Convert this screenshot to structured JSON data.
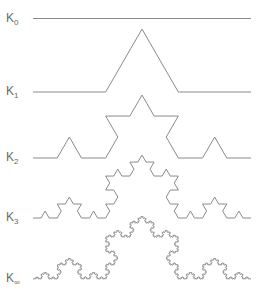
{
  "diagram": {
    "line_color": "#8a8a8a",
    "label_color": "#6a6a6a",
    "x_start": 33,
    "x_end": 251,
    "rows": [
      {
        "base": "K",
        "sub": "0",
        "level": 0,
        "baseline_y": 18.5,
        "label_x": 6,
        "label_y": 12
      },
      {
        "base": "K",
        "sub": "1",
        "level": 1,
        "baseline_y": 92,
        "label_x": 6,
        "label_y": 85
      },
      {
        "base": "K",
        "sub": "2",
        "level": 2,
        "baseline_y": 158,
        "label_x": 6,
        "label_y": 151
      },
      {
        "base": "K",
        "sub": "3",
        "level": 3,
        "baseline_y": 218,
        "label_x": 6,
        "label_y": 211
      },
      {
        "base": "K",
        "sub": "∞",
        "level": 5,
        "baseline_y": 279,
        "label_x": 6,
        "label_y": 272
      }
    ]
  }
}
